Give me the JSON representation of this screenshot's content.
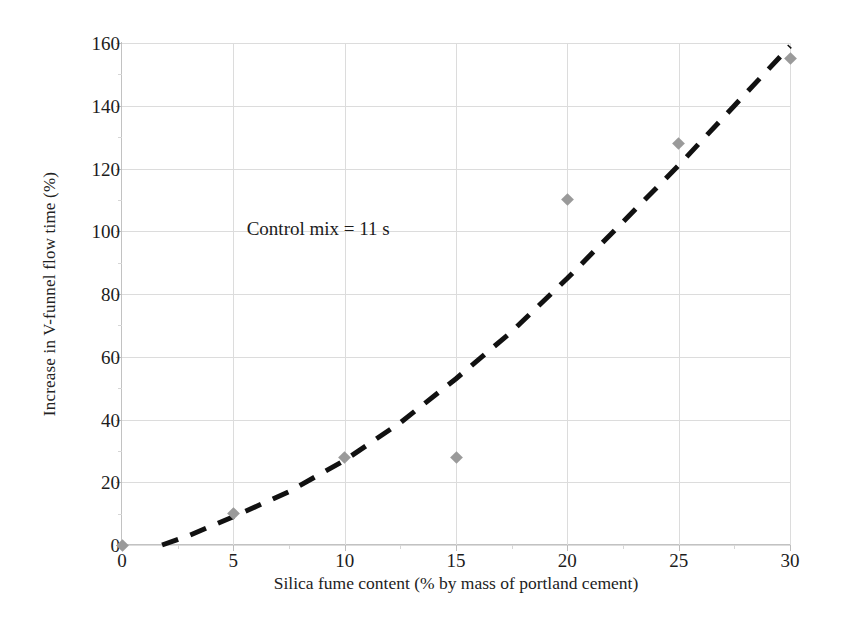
{
  "chart_data": {
    "type": "scatter",
    "title": "",
    "xlabel": "Silica fume content (% by mass of portland cement)",
    "ylabel": "Increase in V-funnel flow time (%)",
    "xlim": [
      0,
      30
    ],
    "ylim": [
      0,
      160
    ],
    "xticks": [
      0,
      5,
      10,
      15,
      20,
      25,
      30
    ],
    "yticks": [
      0,
      20,
      40,
      60,
      80,
      100,
      120,
      140,
      160
    ],
    "xtick_labels": [
      "0",
      "5",
      "10",
      "15",
      "20",
      "25",
      "30"
    ],
    "ytick_labels": [
      "0",
      "20",
      "40",
      "60",
      "80",
      "100",
      "120",
      "140",
      "160"
    ],
    "grid": true,
    "legend": "none",
    "x": [
      0,
      5,
      10,
      15,
      20,
      25,
      30
    ],
    "values": [
      0,
      10,
      28,
      28,
      110,
      128,
      155
    ],
    "series": [
      {
        "name": "Increase in V-funnel flow time",
        "marker": "diamond",
        "marker_color": "#9a9a9a",
        "points": [
          {
            "x": 0,
            "y": 0
          },
          {
            "x": 5,
            "y": 10
          },
          {
            "x": 10,
            "y": 28
          },
          {
            "x": 15,
            "y": 28
          },
          {
            "x": 20,
            "y": 110
          },
          {
            "x": 25,
            "y": 128
          },
          {
            "x": 30,
            "y": 155
          }
        ]
      },
      {
        "name": "Trend line (fitted)",
        "style": "dashed",
        "color": "#111111",
        "points": [
          {
            "x": 1.8,
            "y": 0
          },
          {
            "x": 3,
            "y": 3
          },
          {
            "x": 5,
            "y": 9
          },
          {
            "x": 7.5,
            "y": 17
          },
          {
            "x": 10,
            "y": 27
          },
          {
            "x": 12.5,
            "y": 39
          },
          {
            "x": 15,
            "y": 53
          },
          {
            "x": 17.5,
            "y": 68
          },
          {
            "x": 20,
            "y": 85
          },
          {
            "x": 22.5,
            "y": 103
          },
          {
            "x": 25,
            "y": 121
          },
          {
            "x": 27.5,
            "y": 140
          },
          {
            "x": 30,
            "y": 159
          }
        ]
      }
    ],
    "annotations": [
      {
        "text": "Control mix = 11 s",
        "x": 5.6,
        "y": 101
      }
    ]
  },
  "colors": {
    "marker": "#9a9a9a",
    "trendline": "#111111",
    "grid": "#dcdcdc",
    "axis": "#c2c2c2",
    "text": "#1c1c1c",
    "background": "#ffffff"
  }
}
